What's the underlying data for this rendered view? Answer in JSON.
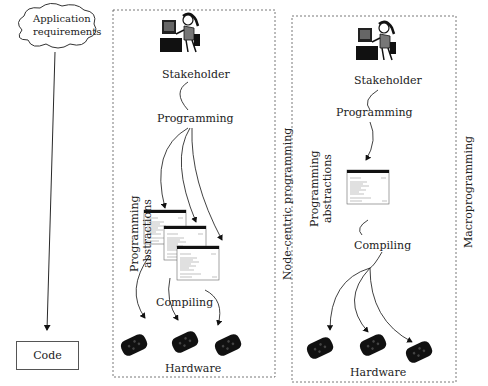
{
  "left": {
    "cloud_label": "Application requirements",
    "code_label": "Code"
  },
  "node_centric": {
    "title": "Node-centric programming",
    "stakeholder_label": "Stakeholder",
    "programming_label": "Programming",
    "abstractions_label_line1": "Programming",
    "abstractions_label_line2": "abstractions",
    "compiling_label": "Compiling",
    "hardware_label": "Hardware"
  },
  "macro": {
    "title": "Macroprogramming",
    "stakeholder_label": "Stakeholder",
    "programming_label": "Programming",
    "abstractions_label_line1": "Programming",
    "abstractions_label_line2": "abstractions",
    "compiling_label": "Compiling",
    "hardware_label": "Hardware"
  }
}
